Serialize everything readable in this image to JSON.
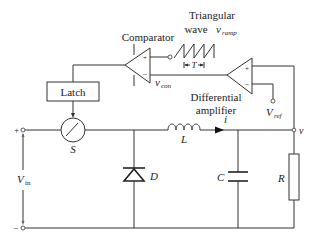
{
  "diagram": {
    "type": "buck-converter-pwm-control",
    "labels": {
      "comparator": "Comparator",
      "triangular_wave_line1": "Triangular",
      "triangular_wave_line2": "wave",
      "v_ramp_main": "v",
      "v_ramp_sub": "ramp",
      "period": "T",
      "v_con_main": "v",
      "v_con_sub": "con",
      "differential_line1": "Differential",
      "differential_line2": "amplifier",
      "v_ref_main": "V",
      "v_ref_sub": "ref",
      "latch": "Latch",
      "switch": "S",
      "inductor": "L",
      "current": "i",
      "output_voltage": "v",
      "diode": "D",
      "capacitor": "C",
      "resistor": "R",
      "v_in_main": "V",
      "v_in_sub": "in",
      "plus": "+",
      "minus": "−",
      "op_plus": "+",
      "op_minus": "−"
    }
  }
}
